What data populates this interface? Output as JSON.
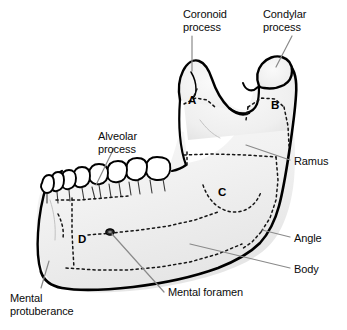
{
  "figure": {
    "colors": {
      "bone_fill": "#f4f4f4",
      "bone_fill_shadow": "#e4e4e4",
      "outline": "#000000",
      "dotted": "#1a1a1a",
      "leader": "#8a8a8a",
      "text": "#0b0b0b",
      "background": "#ffffff"
    }
  },
  "labels": [
    {
      "id": "coronoid-process",
      "text": "Coronoid\nprocess",
      "x": 183,
      "y": 8
    },
    {
      "id": "condylar-process",
      "text": "Condylar\nprocess",
      "x": 263,
      "y": 8
    },
    {
      "id": "alveolar-process",
      "text": "Alveolar\nprocess",
      "x": 98,
      "y": 130
    },
    {
      "id": "ramus",
      "text": "Ramus",
      "x": 294,
      "y": 155
    },
    {
      "id": "angle",
      "text": "Angle",
      "x": 294,
      "y": 232
    },
    {
      "id": "body",
      "text": "Body",
      "x": 294,
      "y": 263
    },
    {
      "id": "mental-foramen",
      "text": "Mental foramen",
      "x": 168,
      "y": 288
    },
    {
      "id": "mental-protuberance",
      "text": "Mental\nprotuberance",
      "x": 10,
      "y": 292
    }
  ],
  "markers": [
    {
      "id": "region-a",
      "text": "A",
      "x": 188,
      "y": 94
    },
    {
      "id": "region-b",
      "text": "B",
      "x": 271,
      "y": 99
    },
    {
      "id": "region-c",
      "text": "C",
      "x": 218,
      "y": 186
    },
    {
      "id": "region-d",
      "text": "D",
      "x": 78,
      "y": 233
    }
  ]
}
